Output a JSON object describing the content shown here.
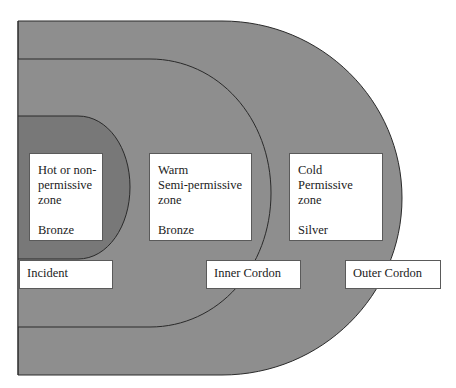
{
  "colors": {
    "outer_zone_fill": "#8e8e8e",
    "middle_zone_fill": "#8e8e8e",
    "inner_zone_fill": "#787878",
    "outline": "#2a2a2a",
    "box_fill": "#ffffff"
  },
  "zones": [
    {
      "id": "hot",
      "lines": [
        "Hot or non-",
        "permissive",
        "zone"
      ],
      "command": "Bronze"
    },
    {
      "id": "warm",
      "lines": [
        "Warm",
        "Semi-permissive",
        "zone"
      ],
      "command": "Bronze"
    },
    {
      "id": "cold",
      "lines": [
        "Cold",
        "Permissive",
        "zone"
      ],
      "command": "Silver"
    }
  ],
  "boundaries": [
    {
      "id": "incident",
      "label": "Incident"
    },
    {
      "id": "inner-cordon",
      "label": "Inner Cordon"
    },
    {
      "id": "outer-cordon",
      "label": "Outer Cordon"
    }
  ]
}
